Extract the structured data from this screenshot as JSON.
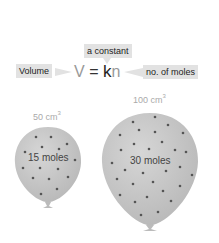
{
  "equation": {
    "lhs": "V",
    "equals": "=",
    "constant_symbol": "k",
    "variable_symbol": "n"
  },
  "labels": {
    "constant": "a constant",
    "volume": "Volume",
    "moles": "no. of moles"
  },
  "balloons": [
    {
      "volume_value": "50 cm",
      "volume_exp": "3",
      "moles": "15 moles",
      "dots": 15
    },
    {
      "volume_value": "100 cm",
      "volume_exp": "3",
      "moles": "30 moles",
      "dots": 30
    }
  ],
  "colors": {
    "balloon_fill": "#c8c8c8",
    "balloon_dot": "#444444",
    "label_bg": "#e2e2e2",
    "symbol_light": "#999999"
  }
}
